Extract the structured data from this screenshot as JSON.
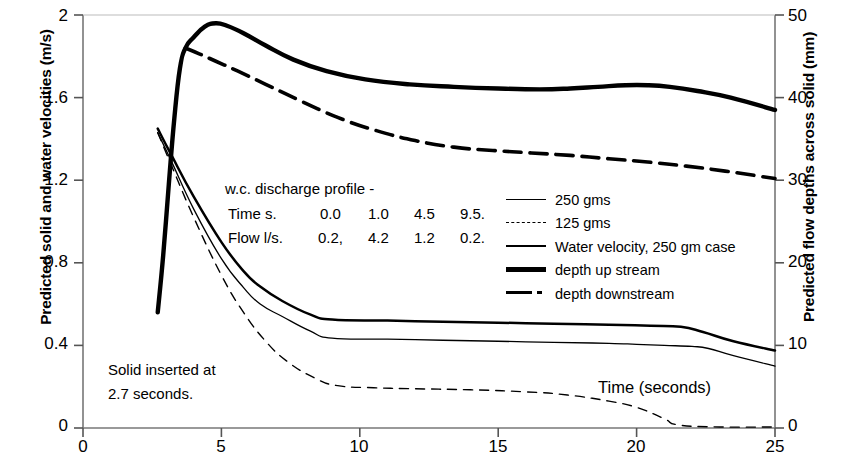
{
  "chart_data": {
    "type": "line",
    "title": "",
    "xlabel": "Time (seconds)",
    "ylabel": "Predicted solid and water velocities (m/s)",
    "ylabel_right": "Predicted flow depths across solid (mm)",
    "xlim": [
      0,
      25
    ],
    "ylim": [
      0,
      2
    ],
    "ylim_right": [
      0,
      50
    ],
    "xticks": [
      "0",
      "5",
      "10",
      "15",
      "20",
      "25"
    ],
    "xtick_values": [
      0,
      5,
      10,
      15,
      20,
      25
    ],
    "yticks_left": [
      "0",
      "0.4",
      "0.8",
      "1.2",
      "1.6",
      "2"
    ],
    "ytick_values_left": [
      0,
      0.4,
      0.8,
      1.2,
      1.6,
      2
    ],
    "yticks_right": [
      "0",
      "10",
      "20",
      "30",
      "40",
      "50"
    ],
    "ytick_values_right": [
      0,
      10,
      20,
      30,
      40,
      50
    ],
    "grid": false,
    "legend_position": "center-right",
    "series": [
      {
        "name": "250 gms",
        "axis": "left",
        "style": "thin-solid",
        "x": [
          2.7,
          3.2,
          4.0,
          5.0,
          5.8,
          6.4,
          7.2,
          8.2,
          9.0,
          11.0,
          13.0,
          15.0,
          17.0,
          19.0,
          20.0,
          21.0,
          22.0,
          22.6,
          23.5,
          25.0
        ],
        "y": [
          1.43,
          1.29,
          1.06,
          0.82,
          0.68,
          0.6,
          0.54,
          0.47,
          0.435,
          0.43,
          0.425,
          0.42,
          0.415,
          0.41,
          0.405,
          0.4,
          0.395,
          0.385,
          0.35,
          0.3
        ]
      },
      {
        "name": "125 gms",
        "axis": "left",
        "style": "thin-dashed",
        "x": [
          2.7,
          3.2,
          4.0,
          5.0,
          5.8,
          6.6,
          7.4,
          8.4,
          9.2,
          10.5,
          12.0,
          14.0,
          16.0,
          17.5,
          19.0,
          20.0,
          21.0,
          21.5,
          23.0,
          25.0
        ],
        "y": [
          1.43,
          1.27,
          1.02,
          0.74,
          0.56,
          0.42,
          0.32,
          0.24,
          0.205,
          0.195,
          0.19,
          0.185,
          0.175,
          0.16,
          0.13,
          0.1,
          0.045,
          0.015,
          0.005,
          0.005
        ]
      },
      {
        "name": "Water velocity, 250 gm case",
        "axis": "left",
        "style": "medium-solid",
        "x": [
          2.7,
          3.2,
          4.0,
          5.0,
          5.8,
          6.4,
          7.2,
          8.2,
          9.0,
          11.0,
          13.0,
          15.0,
          17.0,
          19.0,
          20.5,
          21.6,
          22.4,
          23.5,
          25.0
        ],
        "y": [
          1.45,
          1.32,
          1.12,
          0.9,
          0.76,
          0.685,
          0.615,
          0.55,
          0.525,
          0.52,
          0.515,
          0.51,
          0.505,
          0.5,
          0.495,
          0.49,
          0.465,
          0.42,
          0.375
        ]
      },
      {
        "name": "depth up stream",
        "axis": "right",
        "style": "thick-solid",
        "x": [
          2.7,
          2.9,
          3.1,
          3.3,
          3.5,
          3.7,
          4.0,
          4.4,
          4.8,
          5.2,
          5.8,
          6.6,
          7.6,
          8.8,
          10.2,
          11.8,
          13.4,
          15.0,
          16.5,
          17.6,
          18.6,
          19.6,
          20.4,
          21.2,
          22.2,
          23.4,
          25.0
        ],
        "y": [
          14.0,
          21.0,
          29.5,
          37.5,
          43.5,
          46.0,
          47.3,
          48.6,
          49.0,
          48.7,
          47.8,
          46.3,
          44.6,
          43.2,
          42.2,
          41.6,
          41.3,
          41.1,
          41.0,
          41.1,
          41.3,
          41.5,
          41.5,
          41.3,
          40.8,
          40.0,
          38.5
        ]
      },
      {
        "name": "depth downstream",
        "axis": "right",
        "style": "thick-dashdot",
        "x": [
          3.7,
          4.2,
          4.8,
          5.6,
          6.6,
          7.8,
          9.2,
          10.6,
          12.0,
          13.4,
          14.8,
          16.2,
          17.6,
          19.0,
          20.4,
          21.8,
          23.2,
          25.0
        ],
        "y": [
          46.0,
          45.3,
          44.4,
          43.2,
          41.6,
          39.7,
          37.6,
          36.0,
          34.8,
          34.0,
          33.6,
          33.3,
          33.0,
          32.6,
          32.2,
          31.7,
          31.1,
          30.2
        ]
      }
    ]
  },
  "annotations": {
    "discharge_title": "w.c. discharge profile -",
    "time_row_label": "Time s.",
    "time_values": [
      "0.0",
      "1.0",
      "4.5",
      "9.5."
    ],
    "flow_row_label": "Flow l/s.",
    "flow_values": [
      "0.2,",
      "4.2",
      "1.2",
      "0.2."
    ],
    "solid_note_line1": "Solid inserted at",
    "solid_note_line2": "2.7 seconds.",
    "time_axis_note": "Time (seconds)"
  },
  "legend": {
    "items": [
      {
        "label": "250 gms",
        "key": "thin-solid"
      },
      {
        "label": "125 gms",
        "key": "thin-dashed"
      },
      {
        "label": "Water velocity, 250 gm case",
        "key": "medium-solid"
      },
      {
        "label": "depth up stream",
        "key": "thick-solid"
      },
      {
        "label": "depth downstream",
        "key": "thick-dashdot"
      }
    ]
  },
  "colors": {
    "ink": "#000000",
    "axis": "#6f6f6f"
  }
}
